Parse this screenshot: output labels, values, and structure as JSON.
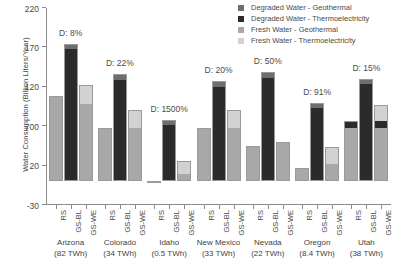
{
  "chart_data": {
    "type": "bar",
    "title": "",
    "xlabel": "",
    "ylabel": "Water Consumption (Billion Liters/Year)",
    "ylim": [
      -30,
      220
    ],
    "yticks": [
      220,
      170,
      120,
      70,
      20,
      -30
    ],
    "ytick_labels": [
      "220",
      "170",
      "120",
      "700",
      "20",
      "-30"
    ],
    "grid": false,
    "stacked": true,
    "legend_position": "top-right",
    "bar_categories": [
      "RS",
      "GS-BL",
      "GS-WE"
    ],
    "series": [
      {
        "name": "Degraded Water - Geothermal",
        "color": "#6e6e6e"
      },
      {
        "name": "Degraded Water - Thermoelectricity",
        "color": "#2b2b2b"
      },
      {
        "name": "Fresh Water - Geothermal",
        "color": "#a8a8a8"
      },
      {
        "name": "Fresh Water - Thermoelectricity",
        "color": "#d2d2d2"
      }
    ],
    "groups": [
      {
        "state": "Arizona",
        "energy": "(82 TWh)",
        "annotation": "D: 8%",
        "bars": [
          {
            "category": "RS",
            "fresh_thermo": 0,
            "fresh_geo": 108,
            "deg_thermo": 0,
            "deg_geo": 0,
            "total": 108
          },
          {
            "category": "GS-BL",
            "fresh_thermo": 0,
            "fresh_geo": 0,
            "deg_thermo": 168,
            "deg_geo": 6,
            "total": 174
          },
          {
            "category": "GS-WE",
            "fresh_thermo": 24,
            "fresh_geo": 98,
            "deg_thermo": 0,
            "deg_geo": 0,
            "total": 122
          }
        ]
      },
      {
        "state": "Colorado",
        "energy": "(34 TWh)",
        "annotation": "D: 22%",
        "bars": [
          {
            "category": "RS",
            "fresh_thermo": 0,
            "fresh_geo": 68,
            "deg_thermo": 0,
            "deg_geo": 0,
            "total": 68
          },
          {
            "category": "GS-BL",
            "fresh_thermo": 0,
            "fresh_geo": 0,
            "deg_thermo": 129,
            "deg_geo": 7,
            "total": 136
          },
          {
            "category": "GS-WE",
            "fresh_thermo": 22,
            "fresh_geo": 68,
            "deg_thermo": 0,
            "deg_geo": 0,
            "total": 90
          }
        ]
      },
      {
        "state": "Idaho",
        "energy": "(0.5 TWh)",
        "annotation": "D: 1500%",
        "bars": [
          {
            "category": "RS",
            "fresh_thermo": 0,
            "fresh_geo": 1,
            "deg_thermo": 0,
            "deg_geo": 0,
            "total": 1
          },
          {
            "category": "GS-BL",
            "fresh_thermo": 0,
            "fresh_geo": 0,
            "deg_thermo": 72,
            "deg_geo": 6,
            "total": 78
          },
          {
            "category": "GS-WE",
            "fresh_thermo": 16,
            "fresh_geo": 10,
            "deg_thermo": 0,
            "deg_geo": 0,
            "total": 26
          }
        ]
      },
      {
        "state": "New Mexico",
        "energy": "(33 TWh)",
        "annotation": "D: 20%",
        "bars": [
          {
            "category": "RS",
            "fresh_thermo": 0,
            "fresh_geo": 68,
            "deg_thermo": 0,
            "deg_geo": 0,
            "total": 68
          },
          {
            "category": "GS-BL",
            "fresh_thermo": 0,
            "fresh_geo": 0,
            "deg_thermo": 120,
            "deg_geo": 7,
            "total": 127
          },
          {
            "category": "GS-WE",
            "fresh_thermo": 22,
            "fresh_geo": 68,
            "deg_thermo": 0,
            "deg_geo": 0,
            "total": 90
          }
        ]
      },
      {
        "state": "Nevada",
        "energy": "(22 TWh)",
        "annotation": "D: 50%",
        "bars": [
          {
            "category": "RS",
            "fresh_thermo": 0,
            "fresh_geo": 45,
            "deg_thermo": 0,
            "deg_geo": 0,
            "total": 45
          },
          {
            "category": "GS-BL",
            "fresh_thermo": 0,
            "fresh_geo": 0,
            "deg_thermo": 131,
            "deg_geo": 8,
            "total": 139
          },
          {
            "category": "GS-WE",
            "fresh_thermo": 0,
            "fresh_geo": 50,
            "deg_thermo": 0,
            "deg_geo": 0,
            "total": 50
          }
        ]
      },
      {
        "state": "Oregon",
        "energy": "(8.4 TWh)",
        "annotation": "D: 91%",
        "bars": [
          {
            "category": "RS",
            "fresh_thermo": 0,
            "fresh_geo": 17,
            "deg_thermo": 0,
            "deg_geo": 0,
            "total": 17
          },
          {
            "category": "GS-BL",
            "fresh_thermo": 0,
            "fresh_geo": 0,
            "deg_thermo": 93,
            "deg_geo": 6,
            "total": 99
          },
          {
            "category": "GS-WE",
            "fresh_thermo": 22,
            "fresh_geo": 22,
            "deg_thermo": 0,
            "deg_geo": 0,
            "total": 44
          }
        ]
      },
      {
        "state": "Utah",
        "energy": "(38 TWh)",
        "annotation": "D: 15%",
        "bars": [
          {
            "category": "RS",
            "fresh_thermo": 0,
            "fresh_geo": 68,
            "deg_thermo": 9,
            "deg_geo": 0,
            "total": 77
          },
          {
            "category": "GS-BL",
            "fresh_thermo": 0,
            "fresh_geo": 0,
            "deg_thermo": 123,
            "deg_geo": 7,
            "total": 130
          },
          {
            "category": "GS-WE",
            "fresh_thermo": 20,
            "fresh_geo": 68,
            "deg_thermo": 9,
            "deg_geo": 0,
            "total": 97
          }
        ]
      }
    ]
  },
  "legend": {
    "items": [
      {
        "label": "Degraded Water - Geothermal",
        "color": "#6e6e6e"
      },
      {
        "label": "Degraded Water - Thermoelectricity",
        "color": "#2b2b2b"
      },
      {
        "label": "Fresh Water - Geothermal",
        "color": "#a8a8a8"
      },
      {
        "label": "Fresh Water - Thermoelectricity",
        "color": "#d2d2d2"
      }
    ]
  }
}
